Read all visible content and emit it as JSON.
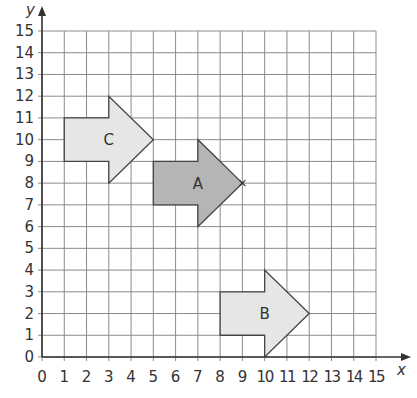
{
  "chart_data": {
    "type": "coordinate-grid",
    "title": "",
    "xlabel": "x",
    "ylabel": "y",
    "xlim": [
      0,
      15
    ],
    "ylim": [
      0,
      15
    ],
    "grid": true,
    "x_ticks": [
      "0",
      "1",
      "2",
      "3",
      "4",
      "5",
      "6",
      "7",
      "8",
      "9",
      "10",
      "11",
      "12",
      "13",
      "14",
      "15"
    ],
    "y_ticks": [
      "0",
      "1",
      "2",
      "3",
      "4",
      "5",
      "6",
      "7",
      "8",
      "9",
      "10",
      "11",
      "12",
      "13",
      "14",
      "15"
    ],
    "shapes": [
      {
        "label": "C",
        "fill": "#e6e6e6",
        "points": [
          [
            1,
            9
          ],
          [
            1,
            11
          ],
          [
            3,
            11
          ],
          [
            3,
            12
          ],
          [
            5,
            10
          ],
          [
            3,
            8
          ],
          [
            3,
            9
          ]
        ],
        "label_pos": [
          3,
          10
        ]
      },
      {
        "label": "A",
        "fill": "#b5b5b5",
        "points": [
          [
            5,
            7
          ],
          [
            5,
            9
          ],
          [
            7,
            9
          ],
          [
            7,
            10
          ],
          [
            9,
            8
          ],
          [
            7,
            6
          ],
          [
            7,
            7
          ]
        ],
        "label_pos": [
          7,
          8
        ]
      },
      {
        "label": "B",
        "fill": "#e6e6e6",
        "points": [
          [
            8,
            1
          ],
          [
            8,
            3
          ],
          [
            10,
            3
          ],
          [
            10,
            4
          ],
          [
            12,
            2
          ],
          [
            10,
            0
          ],
          [
            10,
            1
          ]
        ],
        "label_pos": [
          10,
          2
        ]
      }
    ],
    "annotations": [
      {
        "type": "cross-marker",
        "at": [
          9,
          8
        ]
      }
    ]
  }
}
